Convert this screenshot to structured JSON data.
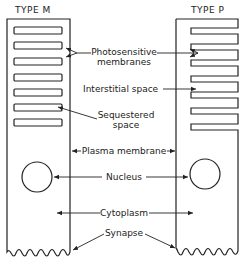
{
  "diagram": {
    "cells": [
      {
        "id": "type-m",
        "title": "TYPE M",
        "disc_structure": "sequestered discs (closed)",
        "disc_count": 7
      },
      {
        "id": "type-p",
        "title": "TYPE P",
        "disc_structure": "plasma membrane infoldings (open)",
        "fold_count": 8
      }
    ],
    "labels": {
      "photosensitive": [
        "Photosensitive",
        "membranes"
      ],
      "interstitial": "Interstitial space",
      "sequestered": [
        "Sequestered",
        "space"
      ],
      "plasma": "Plasma membrane",
      "nucleus": "Nucleus",
      "cytoplasm": "Cytoplasm",
      "synapse": "Synapse"
    },
    "colors": {
      "ink": "#222222",
      "background": "#ffffff"
    }
  }
}
